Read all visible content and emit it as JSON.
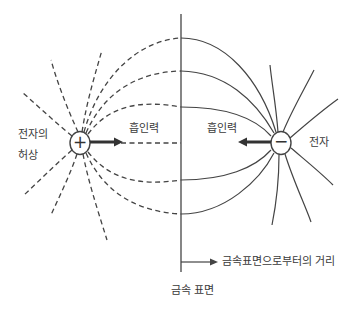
{
  "diagram": {
    "labels": {
      "image_charge": [
        "전자의",
        "허상"
      ],
      "electron": "전자",
      "attraction_left": "흡인력",
      "attraction_right": "흡인력",
      "distance_axis": "금속표면으로부터의 거리",
      "metal_surface": "금속 표면"
    },
    "charges": {
      "positive_symbol": "+",
      "negative_symbol": "−"
    },
    "colors": {
      "line": "#444444",
      "text": "#3a3a3a",
      "background": "#ffffff"
    }
  }
}
